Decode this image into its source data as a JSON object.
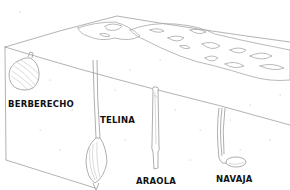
{
  "diagram": {
    "colors": {
      "line": "#9a9a9a",
      "label": "#111111",
      "background": "#ffffff"
    },
    "labels": [
      {
        "id": "berberecho",
        "text": "BERBERECHO"
      },
      {
        "id": "telina",
        "text": "TELINA"
      },
      {
        "id": "araola",
        "text": "ARAOLA"
      },
      {
        "id": "navaja",
        "text": "NAVAJA"
      }
    ]
  }
}
